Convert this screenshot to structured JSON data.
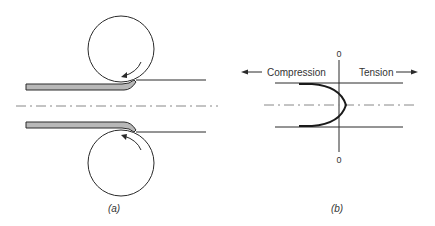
{
  "figure": {
    "panel_a": {
      "caption": "(a)"
    },
    "panel_b": {
      "caption": "(b)",
      "left_label": "Compression",
      "right_label": "Tension",
      "top_zero": "0",
      "bottom_zero": "0"
    },
    "colors": {
      "line": "#2a2a2a",
      "sheet_fill": "#b8b8b8",
      "centerline": "#888888"
    }
  }
}
